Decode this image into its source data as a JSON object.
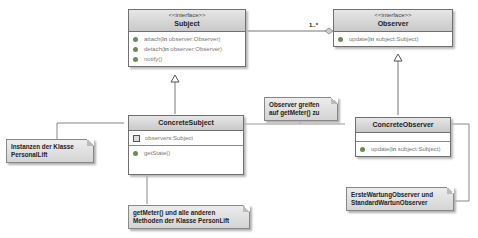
{
  "diagram": {
    "classes": {
      "subject": {
        "stereotype": "<<interface>>",
        "name": "Subject",
        "operations": [
          {
            "name": "attach",
            "param_kw": "in",
            "param": "observer:Observer"
          },
          {
            "name": "detach",
            "param_kw": "in",
            "param": "observer:Observer"
          },
          {
            "name": "notify()",
            "param_kw": "",
            "param": ""
          }
        ]
      },
      "observer": {
        "stereotype": "<<interface>>",
        "name": "Observer",
        "operations": [
          {
            "name": "update",
            "param_kw": "in",
            "param": "subject:Subject"
          }
        ]
      },
      "concrete_subject": {
        "name": "ConcreteSubject",
        "attributes": [
          {
            "name": "observers:Subject"
          }
        ],
        "operations": [
          {
            "name": "getState()"
          }
        ]
      },
      "concrete_observer": {
        "name": "ConcreteObserver",
        "operations": [
          {
            "name": "update",
            "param_kw": "in",
            "param": "subject:Subject"
          }
        ]
      }
    },
    "association": {
      "multiplicity": "1..*"
    },
    "notes": {
      "observer_access": [
        "Observer greifen",
        "auf getMeter() zu"
      ],
      "instances": [
        "Instanzen der Klasse",
        "PersonalLift"
      ],
      "methods": [
        "getMeter() und alle anderen",
        "Methoden der Klasse PersonLift"
      ],
      "observers": [
        "ErsteWartungObserver und",
        "StandardWartunObserver"
      ]
    }
  }
}
